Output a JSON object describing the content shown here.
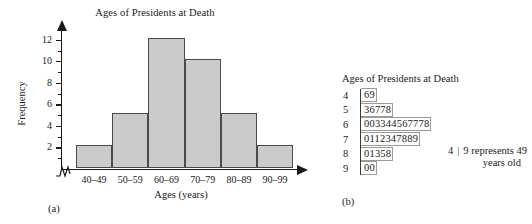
{
  "figure": {
    "panel_a_label": "(a)",
    "panel_b_label": "(b)"
  },
  "chart_data": [
    {
      "type": "bar",
      "title": "Ages of Presidents at Death",
      "xlabel": "Ages (years)",
      "ylabel": "Frequency",
      "categories": [
        "40–49",
        "50–59",
        "60–69",
        "70–79",
        "80–89",
        "90–99"
      ],
      "values": [
        2,
        5,
        12,
        10,
        5,
        2
      ],
      "ylim": [
        0,
        13
      ],
      "yticks": [
        2,
        4,
        6,
        8,
        10,
        12
      ],
      "ytick_labels": [
        "2",
        "4",
        "6",
        "8",
        "10",
        "12"
      ],
      "grid": false,
      "legend": "none",
      "bar_fill": "#cbcbcb",
      "bar_stroke": "#4a4a4a",
      "axis_break": true
    },
    {
      "type": "table",
      "title": "Ages of Presidents at Death",
      "stems": [
        "4",
        "5",
        "6",
        "7",
        "8",
        "9"
      ],
      "leaves": [
        "69",
        "36778",
        "003344567778",
        "0112347889",
        "01358",
        "00"
      ],
      "legend_stem": "4",
      "legend_separator": "|",
      "legend_leaf": "9",
      "legend_text": "represents 49",
      "legend_text_line2": "years old",
      "counts": [
        2,
        5,
        12,
        10,
        5,
        2
      ]
    }
  ]
}
